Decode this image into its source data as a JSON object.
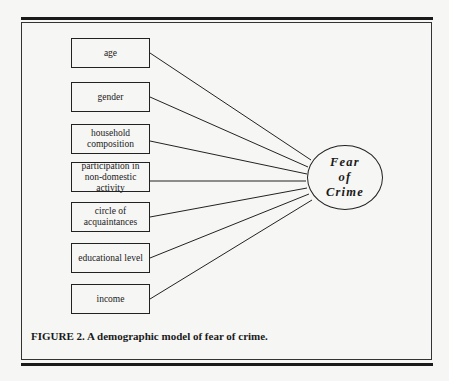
{
  "figure": {
    "caption": "FIGURE 2. A demographic model of fear of crime.",
    "outcome": "Fear\nof\nCrime",
    "predictors": [
      {
        "label": "age"
      },
      {
        "label": "gender"
      },
      {
        "label": "household composition"
      },
      {
        "label": "participation in non-domestic activity"
      },
      {
        "label": "circle of acquaintances"
      },
      {
        "label": "educational level"
      },
      {
        "label": "income"
      }
    ]
  }
}
